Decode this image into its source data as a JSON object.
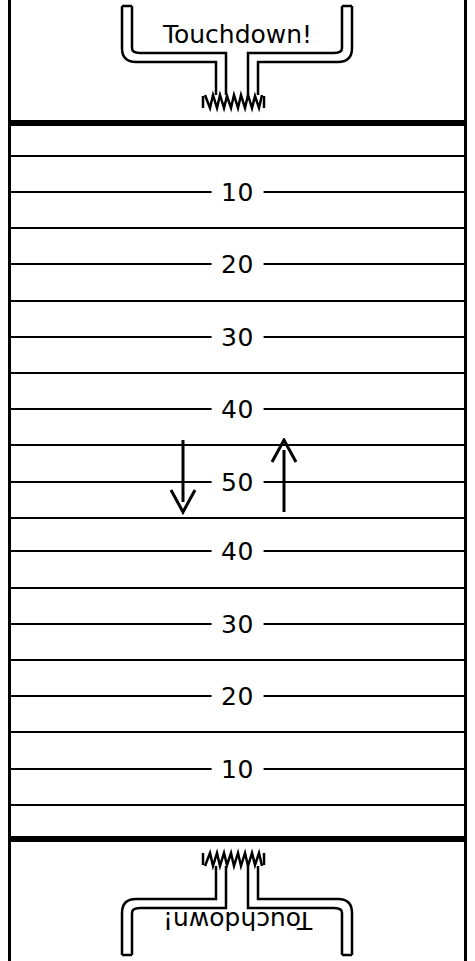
{
  "diagram": {
    "colors": {
      "line": "#000000",
      "background": "#ffffff"
    },
    "endzones": [
      {
        "label": "Touchdown!",
        "position": "top",
        "rotated": false
      },
      {
        "label": "Touchdown!",
        "position": "bottom",
        "rotated": true
      }
    ],
    "yard_lines": [
      {
        "label": "10",
        "y": 191
      },
      {
        "label": "20",
        "y": 263
      },
      {
        "label": "30",
        "y": 336
      },
      {
        "label": "40",
        "y": 408
      },
      {
        "label": "50",
        "y": 481
      },
      {
        "label": "40",
        "y": 550
      },
      {
        "label": "30",
        "y": 623
      },
      {
        "label": "20",
        "y": 695
      },
      {
        "label": "10",
        "y": 768
      }
    ],
    "unlabeled_yard_lines": [
      {
        "y": 155
      },
      {
        "y": 227
      },
      {
        "y": 300
      },
      {
        "y": 372
      },
      {
        "y": 444
      },
      {
        "y": 517
      },
      {
        "y": 587
      },
      {
        "y": 659
      },
      {
        "y": 731
      },
      {
        "y": 804
      }
    ],
    "goal_lines": [
      {
        "y": 120
      },
      {
        "y": 836
      }
    ],
    "arrows": [
      {
        "name": "down-arrow",
        "direction": "down",
        "x": 181,
        "y": 441,
        "length": 72
      },
      {
        "name": "up-arrow",
        "direction": "up",
        "x": 283,
        "y": 441,
        "length": 72
      }
    ],
    "goal_posts": [
      {
        "name": "top-goal-post",
        "position": "top"
      },
      {
        "name": "bottom-goal-post",
        "position": "bottom"
      }
    ]
  }
}
